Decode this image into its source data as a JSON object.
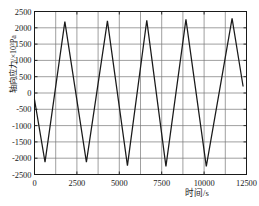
{
  "chart_data": {
    "type": "line",
    "title": "",
    "subtitle": "",
    "xlabel": "时间/s",
    "ylabel": "轴向应力/×10³Pa",
    "xlim": [
      0,
      12500
    ],
    "ylim": [
      -2500,
      2500
    ],
    "xticks": [
      0,
      2500,
      5000,
      7500,
      10000,
      12500
    ],
    "xtick_labels": [
      "0",
      "2500",
      "5000",
      "7500",
      "10000",
      "12500"
    ],
    "yticks": [
      -2500,
      -2000,
      -1500,
      -1000,
      -500,
      0,
      500,
      1000,
      1500,
      2000,
      2500
    ],
    "ytick_labels": [
      "-2500",
      "-2000",
      "-1500",
      "-1000",
      "-500",
      "0",
      "500",
      "1000",
      "1500",
      "2000",
      "2500"
    ],
    "grid": {
      "x_major_step": 1250,
      "y_major_step": 500,
      "visible": true,
      "color": "#777777"
    },
    "legend": {
      "visible": false,
      "position": "none",
      "entries": []
    },
    "series": [
      {
        "name": "轴向应力",
        "color": "#1a1a1a",
        "line_width": 1.25,
        "x": [
          0,
          620,
          1790,
          3060,
          4300,
          5480,
          6620,
          7750,
          8930,
          10130,
          11650,
          12300
        ],
        "y": [
          -200,
          -2120,
          2190,
          -2120,
          2210,
          -2230,
          2230,
          -2250,
          2260,
          -2250,
          2290,
          200
        ]
      }
    ],
    "annotations": []
  },
  "axis": {
    "y_label_text": "轴向应力/×10³Pa",
    "x_label_text": "时间/s"
  }
}
